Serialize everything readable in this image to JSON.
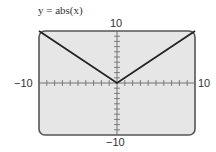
{
  "title": "y = abs(x)",
  "chart_data": {
    "type": "line",
    "title": "y = abs(x)",
    "xlabel": "",
    "ylabel": "",
    "xlim": [
      -10,
      10
    ],
    "ylim": [
      -10,
      10
    ],
    "x": [
      -10,
      0,
      10
    ],
    "series": [
      {
        "name": "y = abs(x)",
        "values": [
          10,
          0,
          10
        ]
      }
    ],
    "tick_labels": {
      "x_min": "−10",
      "x_max": "10",
      "y_min": "−10",
      "y_max": "10"
    },
    "tick_step": 1,
    "grid": false,
    "background": "#e6e6e6",
    "line_color": "#222222"
  }
}
